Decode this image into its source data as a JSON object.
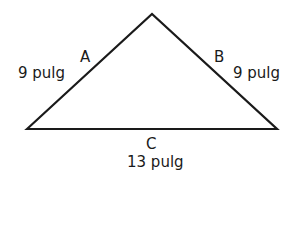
{
  "triangle": {
    "stroke_color": "#1a1a1a",
    "vertices": {
      "left": [
        27,
        129
      ],
      "apex": [
        152,
        14
      ],
      "right": [
        277,
        129
      ]
    },
    "sides": [
      {
        "name": "A",
        "length": "9 pulg"
      },
      {
        "name": "B",
        "length": "9 pulg"
      },
      {
        "name": "C",
        "length": "13 pulg"
      }
    ]
  }
}
